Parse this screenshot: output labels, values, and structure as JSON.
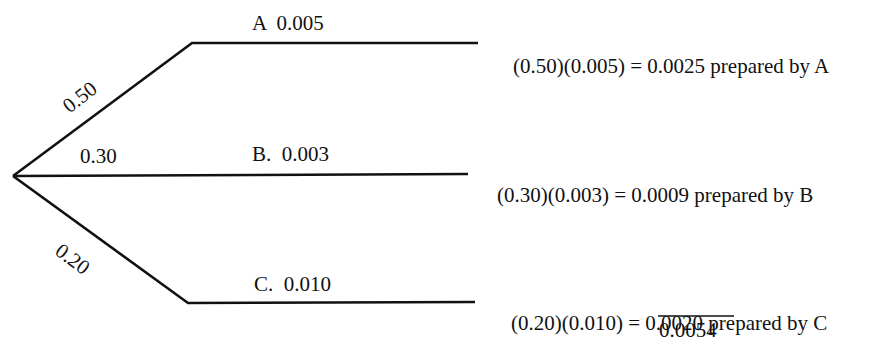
{
  "diagram": {
    "type": "probability-tree",
    "root": {
      "x": 13,
      "y": 176
    },
    "branches": [
      {
        "id": "A",
        "prior_label": "0.50",
        "prior": 0.5,
        "node_label": "A  0.005",
        "likelihood": 0.005,
        "result_expr": "(0.50)(0.005) = ",
        "result_value": "0.0025",
        "result_suffix": " prepared by A"
      },
      {
        "id": "B",
        "prior_label": "0.30",
        "prior": 0.3,
        "node_label": "B.  0.003",
        "likelihood": 0.003,
        "result_expr": "(0.30)(0.003) = ",
        "result_value": "0.0009",
        "result_suffix": " prepared by B"
      },
      {
        "id": "C",
        "prior_label": "0.20",
        "prior": 0.2,
        "node_label": "C.  0.010",
        "likelihood": 0.01,
        "result_expr": "(0.20)(0.010) = ",
        "result_value": "0.0020",
        "result_suffix": " prepared by C"
      }
    ],
    "total": "0.0054",
    "line_color": "#111111"
  }
}
